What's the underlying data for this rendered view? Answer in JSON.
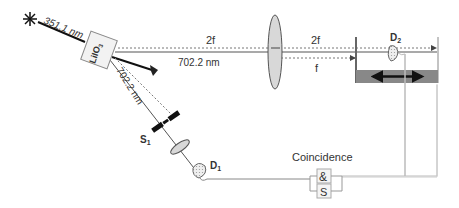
{
  "diagram": {
    "source": {
      "icon": "star-burst-icon",
      "wavelength_label": "351.1 nm"
    },
    "crystal": {
      "label": "LiIO",
      "subscript": "3"
    },
    "beam_upper": {
      "label": "702.2 nm"
    },
    "beam_lower": {
      "label": "702.2 nm"
    },
    "distance_labels": {
      "left_2f": "2f",
      "right_2f": "2f",
      "f": "f"
    },
    "slit": {
      "label": "S",
      "subscript": "1"
    },
    "detector1": {
      "label": "D",
      "subscript": "1"
    },
    "detector2": {
      "label": "D",
      "subscript": "2"
    },
    "coincidence": {
      "title": "Coincidence",
      "and_symbol": "&",
      "s_symbol": "S"
    }
  },
  "colors": {
    "beam": "#222222",
    "dashed": "#777777",
    "lens_fill": "#d8d8d8",
    "wire": "#bbbbbb",
    "stage": "#888888"
  }
}
